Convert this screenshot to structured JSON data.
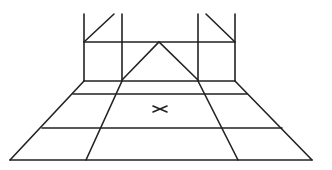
{
  "diagram": {
    "stroke_color": "#222222",
    "background": "#ffffff",
    "marker": {
      "label": "X",
      "cx": 160,
      "cy": 109
    }
  }
}
